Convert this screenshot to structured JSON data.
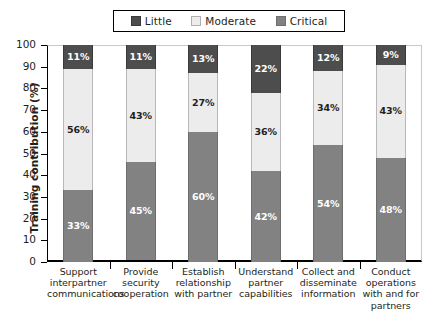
{
  "chart_data": {
    "type": "bar",
    "subtype": "stacked-bar-100",
    "title": "",
    "xlabel": "",
    "ylabel": "Training contribution (%)",
    "ylim": [
      0,
      100
    ],
    "ytick_step": 10,
    "yticks": [
      "100",
      "90",
      "80",
      "70",
      "60",
      "50",
      "40",
      "30",
      "20",
      "10",
      "0"
    ],
    "grid": false,
    "legend_position": "top-center",
    "value_suffix": "%",
    "categories": [
      "Support interpartner communications",
      "Provide security cooperation",
      "Establish relationship with partner",
      "Understand partner capabilities",
      "Collect and disseminate information",
      "Conduct operations with and for partners"
    ],
    "category_lines": [
      [
        "Support",
        "interpartner",
        "communications"
      ],
      [
        "Provide",
        "security",
        "cooperation"
      ],
      [
        "Establish",
        "relationship",
        "with partner"
      ],
      [
        "Understand",
        "partner",
        "capabilities"
      ],
      [
        "Collect and",
        "disseminate",
        "information"
      ],
      [
        "Conduct",
        "operations",
        "with and for",
        "partners"
      ]
    ],
    "series": [
      {
        "name": "Critical",
        "color": "#828282",
        "values": [
          33,
          45,
          60,
          42,
          54,
          48
        ],
        "labels": [
          "33%",
          "45%",
          "60%",
          "42%",
          "54%",
          "48%"
        ]
      },
      {
        "name": "Moderate",
        "color": "#ececec",
        "values": [
          56,
          43,
          27,
          36,
          34,
          43
        ],
        "labels": [
          "56%",
          "43%",
          "27%",
          "36%",
          "34%",
          "43%"
        ]
      },
      {
        "name": "Little",
        "color": "#4d4d4d",
        "values": [
          11,
          11,
          13,
          22,
          12,
          9
        ],
        "labels": [
          "11%",
          "11%",
          "13%",
          "22%",
          "12%",
          "9%"
        ]
      }
    ],
    "stack_order_top_to_bottom": [
      "Little",
      "Moderate",
      "Critical"
    ]
  },
  "legend": {
    "items": [
      {
        "label": "Little",
        "color": "#4d4d4d"
      },
      {
        "label": "Moderate",
        "color": "#ececec"
      },
      {
        "label": "Critical",
        "color": "#828282"
      }
    ]
  }
}
